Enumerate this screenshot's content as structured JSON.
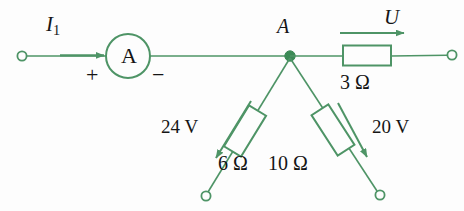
{
  "figure": {
    "type": "electrical-circuit-diagram",
    "background_color": "#fdfdfd",
    "wire_color": "#4e9466",
    "text_color": "#151515"
  },
  "labels": {
    "current_I1": "I",
    "current_I1_subscript": "1",
    "ammeter_symbol": "A",
    "polarity_plus": "+",
    "polarity_minus": "−",
    "node_A": "A",
    "voltage_U": "U",
    "resistor_3ohm": "3 Ω",
    "source_24v": "24 V",
    "resistor_6ohm": "6 Ω",
    "source_20v": "20 V",
    "resistor_10ohm": "10 Ω"
  },
  "components": {
    "ammeter": {
      "symbol": "A",
      "cx": 128,
      "cy": 56,
      "r": 22
    },
    "terminals": [
      {
        "name": "left-terminal",
        "cx": 22,
        "cy": 56
      },
      {
        "name": "right-terminal",
        "cx": 452,
        "cy": 55
      },
      {
        "name": "lower-left-terminal",
        "cx": 206,
        "cy": 196
      },
      {
        "name": "lower-right-terminal",
        "cx": 380,
        "cy": 195
      }
    ],
    "node": {
      "name": "node-A",
      "cx": 290,
      "cy": 56,
      "r": 5
    },
    "resistors": [
      {
        "name": "resistor-3ohm",
        "value": "3 Ω",
        "orientation": "horizontal"
      },
      {
        "name": "resistor-6ohm",
        "value": "6 Ω",
        "orientation": "diagonal-left"
      },
      {
        "name": "resistor-10ohm",
        "value": "10 Ω",
        "orientation": "diagonal-right"
      }
    ],
    "arrows": [
      {
        "name": "current-arrow-I1",
        "label": "I1",
        "direction": "right"
      },
      {
        "name": "voltage-arrow-U",
        "label": "U",
        "direction": "right"
      },
      {
        "name": "voltage-arrow-24v",
        "label": "24 V",
        "direction": "down-left"
      },
      {
        "name": "voltage-arrow-20v",
        "label": "20 V",
        "direction": "down-right"
      }
    ]
  }
}
